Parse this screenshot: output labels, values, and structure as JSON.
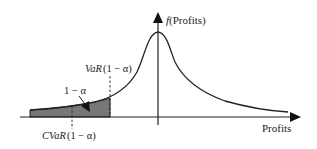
{
  "diagram": {
    "y_axis_label": "f(Profits)",
    "y_axis_label_func": "f",
    "y_axis_label_arg": "(Profits)",
    "x_axis_label": "Profits",
    "var_label": "VaR (1 − α)",
    "var_label_name": "VaR",
    "var_label_arg": "(1 − α)",
    "cvar_label": "CVaR (1 − α)",
    "cvar_label_name": "CVaR",
    "cvar_label_arg": "(1 − α)",
    "tail_label": "1 − α",
    "colors": {
      "line": "#222222",
      "shaded_tail": "#777777",
      "background": "#ffffff"
    }
  }
}
